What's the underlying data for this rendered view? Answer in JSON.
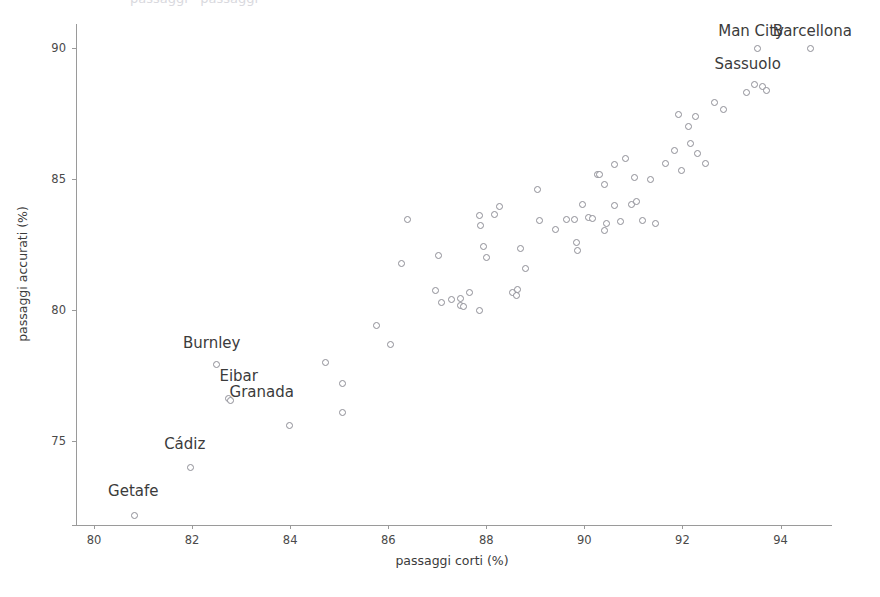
{
  "chart_data": {
    "type": "scatter",
    "title": "",
    "xlabel": "passaggi corti (%)",
    "ylabel": "passaggi accurati (%)",
    "xlim": [
      79.55,
      95.05
    ],
    "ylim": [
      71.8,
      90.9
    ],
    "xticks": [
      80,
      82,
      84,
      86,
      88,
      90,
      92,
      94
    ],
    "yticks": [
      75,
      80,
      85,
      90
    ],
    "xtick_labels": [
      "80",
      "82",
      "84",
      "86",
      "88",
      "90",
      "92",
      "94"
    ],
    "ytick_labels": [
      "75",
      "80",
      "85",
      "90"
    ],
    "grid": false,
    "legend": null,
    "marker": "open-circle",
    "marker_color": "#8e8e96",
    "points": [
      {
        "x": 80.82,
        "y": 72.2,
        "label": "Getafe"
      },
      {
        "x": 81.95,
        "y": 74.0,
        "label": "Cádiz"
      },
      {
        "x": 82.48,
        "y": 77.92,
        "label": "Burnley"
      },
      {
        "x": 82.73,
        "y": 76.65,
        "label": "Eibar"
      },
      {
        "x": 82.78,
        "y": 76.55,
        "label": "Granada"
      },
      {
        "x": 83.97,
        "y": 75.6,
        "label": null
      },
      {
        "x": 84.7,
        "y": 78.02,
        "label": null
      },
      {
        "x": 85.06,
        "y": 77.2,
        "label": null
      },
      {
        "x": 85.06,
        "y": 76.12,
        "label": null
      },
      {
        "x": 85.76,
        "y": 79.42,
        "label": null
      },
      {
        "x": 86.03,
        "y": 78.7,
        "label": null
      },
      {
        "x": 86.38,
        "y": 83.45,
        "label": null
      },
      {
        "x": 86.25,
        "y": 81.78,
        "label": null
      },
      {
        "x": 87.01,
        "y": 82.1,
        "label": null
      },
      {
        "x": 87.07,
        "y": 80.3,
        "label": null
      },
      {
        "x": 87.27,
        "y": 80.42,
        "label": null
      },
      {
        "x": 87.46,
        "y": 80.45,
        "label": null
      },
      {
        "x": 87.46,
        "y": 80.2,
        "label": null
      },
      {
        "x": 87.52,
        "y": 80.16,
        "label": null
      },
      {
        "x": 87.65,
        "y": 80.7,
        "label": null
      },
      {
        "x": 87.85,
        "y": 80.0,
        "label": null
      },
      {
        "x": 87.86,
        "y": 83.6,
        "label": null
      },
      {
        "x": 87.88,
        "y": 83.22,
        "label": null
      },
      {
        "x": 87.94,
        "y": 82.45,
        "label": null
      },
      {
        "x": 87.99,
        "y": 82.0,
        "label": null
      },
      {
        "x": 88.16,
        "y": 83.65,
        "label": null
      },
      {
        "x": 88.53,
        "y": 80.7,
        "label": null
      },
      {
        "x": 88.6,
        "y": 80.55,
        "label": null
      },
      {
        "x": 88.69,
        "y": 82.35,
        "label": null
      },
      {
        "x": 88.78,
        "y": 81.6,
        "label": null
      },
      {
        "x": 89.07,
        "y": 83.42,
        "label": null
      },
      {
        "x": 89.4,
        "y": 83.1,
        "label": null
      },
      {
        "x": 89.04,
        "y": 84.6,
        "label": null
      },
      {
        "x": 89.62,
        "y": 83.45,
        "label": null
      },
      {
        "x": 89.78,
        "y": 83.45,
        "label": null
      },
      {
        "x": 89.83,
        "y": 82.6,
        "label": null
      },
      {
        "x": 89.85,
        "y": 82.3,
        "label": null
      },
      {
        "x": 90.07,
        "y": 83.55,
        "label": null
      },
      {
        "x": 90.16,
        "y": 83.5,
        "label": null
      },
      {
        "x": 90.26,
        "y": 85.2,
        "label": null
      },
      {
        "x": 90.3,
        "y": 85.18,
        "label": null
      },
      {
        "x": 90.4,
        "y": 84.8,
        "label": null
      },
      {
        "x": 90.44,
        "y": 83.3,
        "label": null
      },
      {
        "x": 90.4,
        "y": 83.05,
        "label": null
      },
      {
        "x": 90.72,
        "y": 83.4,
        "label": null
      },
      {
        "x": 91.02,
        "y": 85.05,
        "label": null
      },
      {
        "x": 90.95,
        "y": 84.05,
        "label": null
      },
      {
        "x": 91.18,
        "y": 83.42,
        "label": null
      },
      {
        "x": 91.44,
        "y": 83.3,
        "label": null
      },
      {
        "x": 90.6,
        "y": 85.55,
        "label": null
      },
      {
        "x": 90.82,
        "y": 85.8,
        "label": null
      },
      {
        "x": 91.33,
        "y": 85.0,
        "label": null
      },
      {
        "x": 91.64,
        "y": 85.6,
        "label": null
      },
      {
        "x": 91.98,
        "y": 85.35,
        "label": null
      },
      {
        "x": 91.82,
        "y": 86.1,
        "label": null
      },
      {
        "x": 92.16,
        "y": 86.35,
        "label": null
      },
      {
        "x": 92.47,
        "y": 85.6,
        "label": null
      },
      {
        "x": 91.9,
        "y": 87.45,
        "label": null
      },
      {
        "x": 92.25,
        "y": 87.4,
        "label": null
      },
      {
        "x": 92.12,
        "y": 87.0,
        "label": null
      },
      {
        "x": 92.65,
        "y": 87.92,
        "label": null
      },
      {
        "x": 92.82,
        "y": 87.65,
        "label": null
      },
      {
        "x": 93.3,
        "y": 88.3,
        "label": null
      },
      {
        "x": 93.62,
        "y": 88.52,
        "label": null
      },
      {
        "x": 93.7,
        "y": 88.4,
        "label": null
      },
      {
        "x": 93.53,
        "y": 89.98,
        "label": "Man City"
      },
      {
        "x": 94.6,
        "y": 89.98,
        "label": "Barcellona"
      },
      {
        "x": 93.45,
        "y": 88.6,
        "label": "Sassuolo"
      },
      {
        "x": 92.3,
        "y": 86.0,
        "label": null
      },
      {
        "x": 91.05,
        "y": 84.15,
        "label": null
      },
      {
        "x": 90.6,
        "y": 84.0,
        "label": null
      },
      {
        "x": 89.95,
        "y": 84.05,
        "label": null
      },
      {
        "x": 88.25,
        "y": 83.95,
        "label": null
      },
      {
        "x": 88.62,
        "y": 80.8,
        "label": null
      },
      {
        "x": 86.95,
        "y": 80.75,
        "label": null
      }
    ],
    "annotations": [
      {
        "text": "Man City",
        "x": 93.4,
        "y": 90.6
      },
      {
        "text": "Barcellona",
        "x": 94.65,
        "y": 90.6
      },
      {
        "text": "Sassuolo",
        "x": 93.33,
        "y": 89.35
      },
      {
        "text": "Burnley",
        "x": 82.4,
        "y": 78.7
      },
      {
        "text": "Eibar",
        "x": 82.95,
        "y": 77.45
      },
      {
        "text": "Granada",
        "x": 83.42,
        "y": 76.85
      },
      {
        "text": "Cádiz",
        "x": 81.85,
        "y": 74.85
      },
      {
        "text": "Getafe",
        "x": 80.8,
        "y": 73.05
      }
    ],
    "top_clipped_text": "passaggi · passaggi"
  }
}
